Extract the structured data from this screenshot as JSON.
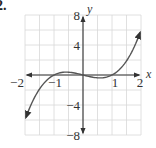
{
  "problem_number": "2.",
  "chart_data": {
    "type": "line",
    "title": "",
    "xlabel": "x",
    "ylabel": "y",
    "xlim": [
      -2,
      2
    ],
    "ylim": [
      -8,
      8
    ],
    "grid": true,
    "grid_step_x": 0.5,
    "grid_step_y": 2,
    "x_tick_labels": [
      "−2",
      "−1",
      "1",
      "2"
    ],
    "y_tick_labels": [
      "8",
      "4",
      "−4",
      "−8"
    ],
    "function": "y = x^3 - x",
    "series": [
      {
        "name": "curve",
        "x": [
          -2,
          -1.5,
          -1,
          -0.577,
          0,
          0.577,
          1,
          1.5,
          2
        ],
        "y": [
          -6,
          -1.875,
          0,
          0.385,
          0,
          -0.385,
          0,
          1.875,
          6
        ]
      }
    ],
    "colors": {
      "curve": "#555555",
      "axes": "#333333",
      "grid": "#d8d8d8"
    }
  }
}
